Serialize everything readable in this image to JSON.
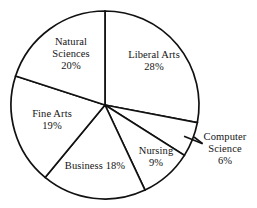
{
  "chart_data": {
    "type": "pie",
    "title": "",
    "xlabel": "",
    "ylabel": "",
    "legend": "none",
    "grid": false,
    "start_angle_deg": 0,
    "direction": "clockwise",
    "units": "percent",
    "total": 100,
    "categories": [
      "Liberal Arts",
      "Computer Science",
      "Nursing",
      "Business",
      "Fine Arts",
      "Natural Sciences"
    ],
    "values": [
      28,
      6,
      9,
      18,
      19,
      20
    ],
    "slices": [
      {
        "name": "Liberal Arts",
        "value": 28,
        "value_label": "28%",
        "label_lines": [
          "Liberal Arts",
          "28%"
        ],
        "label_placement": "inside",
        "label_left": 117,
        "label_top": 49,
        "label_width": 74,
        "inline": false
      },
      {
        "name": "Computer Science",
        "value": 6,
        "value_label": "6%",
        "label_lines": [
          "Computer",
          "Science",
          "6%"
        ],
        "label_placement": "outside",
        "label_left": 196,
        "label_top": 131,
        "label_width": 58,
        "inline": false
      },
      {
        "name": "Nursing",
        "value": 9,
        "value_label": "9%",
        "label_lines": [
          "Nursing",
          "9%"
        ],
        "label_placement": "inside",
        "label_left": 134,
        "label_top": 145,
        "label_width": 44,
        "inline": false
      },
      {
        "name": "Business",
        "value": 18,
        "value_label": "18%",
        "label_lines": [
          "Business 18%"
        ],
        "label_placement": "inside",
        "label_left": 56,
        "label_top": 160,
        "label_width": 78,
        "inline": true
      },
      {
        "name": "Fine Arts",
        "value": 19,
        "value_label": "19%",
        "label_lines": [
          "Fine Arts",
          "19%"
        ],
        "label_placement": "inside",
        "label_left": 24,
        "label_top": 108,
        "label_width": 56,
        "inline": false
      },
      {
        "name": "Natural Sciences",
        "value": 20,
        "value_label": "20%",
        "label_lines": [
          "Natural",
          "Sciences",
          "20%"
        ],
        "label_placement": "inside",
        "label_left": 41,
        "label_top": 36,
        "label_width": 60,
        "inline": false
      }
    ],
    "geometry": {
      "center_x": 105,
      "center_y": 105,
      "radius": 94
    },
    "colors": {
      "slice_fill": "#ffffff",
      "slice_stroke": "#111111",
      "text": "#141414",
      "background": "#ffffff"
    }
  }
}
